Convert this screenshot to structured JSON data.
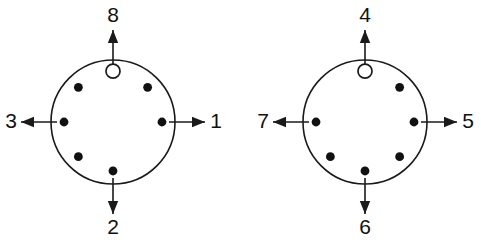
{
  "figure": {
    "type": "two-circle-port-diagram",
    "background_color": "#ffffff",
    "stroke_color": "#1a1a1a",
    "dot_color": "#111111",
    "open_marker_fill": "#ffffff",
    "diagrams": [
      {
        "name": "left-circle-diagram",
        "center_x": 113,
        "center_y": 122,
        "radius": 62,
        "open_marker": {
          "name": "reference-marker",
          "angle_deg": 90,
          "radius_fraction": 0.82,
          "radius_px": 7,
          "style": "open"
        },
        "dots": [
          {
            "name": "dot-e",
            "angle_deg": 0,
            "radius_fraction": 0.79,
            "style": "filled"
          },
          {
            "name": "dot-ne",
            "angle_deg": 45,
            "radius_fraction": 0.79,
            "style": "filled"
          },
          {
            "name": "dot-nw",
            "angle_deg": 135,
            "radius_fraction": 0.79,
            "style": "filled"
          },
          {
            "name": "dot-w",
            "angle_deg": 180,
            "radius_fraction": 0.79,
            "style": "filled"
          },
          {
            "name": "dot-sw",
            "angle_deg": 225,
            "radius_fraction": 0.79,
            "style": "filled"
          },
          {
            "name": "dot-s",
            "angle_deg": 270,
            "radius_fraction": 0.79,
            "style": "filled"
          }
        ],
        "missing_dot_angle_deg": 315,
        "arrows": [
          {
            "name": "arrow-north",
            "angle_deg": 90,
            "label": "8",
            "label_x": 113,
            "label_y": 16
          },
          {
            "name": "arrow-east",
            "angle_deg": 0,
            "label": "1",
            "label_x": 216,
            "label_y": 122
          },
          {
            "name": "arrow-south",
            "angle_deg": 270,
            "label": "2",
            "label_x": 113,
            "label_y": 228
          },
          {
            "name": "arrow-west",
            "angle_deg": 180,
            "label": "3",
            "label_x": 11,
            "label_y": 122
          }
        ]
      },
      {
        "name": "right-circle-diagram",
        "center_x": 365,
        "center_y": 122,
        "radius": 62,
        "open_marker": {
          "name": "reference-marker",
          "angle_deg": 90,
          "radius_fraction": 0.82,
          "radius_px": 7,
          "style": "open"
        },
        "dots": [
          {
            "name": "dot-e",
            "angle_deg": 0,
            "radius_fraction": 0.79,
            "style": "filled"
          },
          {
            "name": "dot-ne",
            "angle_deg": 45,
            "radius_fraction": 0.79,
            "style": "filled"
          },
          {
            "name": "dot-w",
            "angle_deg": 180,
            "radius_fraction": 0.79,
            "style": "filled"
          },
          {
            "name": "dot-sw",
            "angle_deg": 225,
            "radius_fraction": 0.79,
            "style": "filled"
          },
          {
            "name": "dot-s",
            "angle_deg": 270,
            "radius_fraction": 0.79,
            "style": "filled"
          },
          {
            "name": "dot-se",
            "angle_deg": 315,
            "radius_fraction": 0.79,
            "style": "filled"
          }
        ],
        "missing_dot_angle_deg": 135,
        "arrows": [
          {
            "name": "arrow-north",
            "angle_deg": 90,
            "label": "4",
            "label_x": 365,
            "label_y": 16
          },
          {
            "name": "arrow-east",
            "angle_deg": 0,
            "label": "5",
            "label_x": 468,
            "label_y": 122
          },
          {
            "name": "arrow-south",
            "angle_deg": 270,
            "label": "6",
            "label_x": 365,
            "label_y": 228
          },
          {
            "name": "arrow-west",
            "angle_deg": 180,
            "label": "7",
            "label_x": 263,
            "label_y": 122
          }
        ]
      }
    ]
  }
}
